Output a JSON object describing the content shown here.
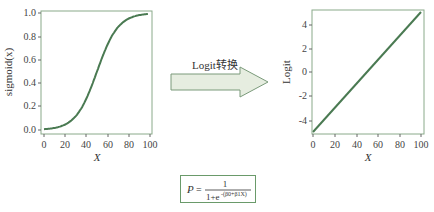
{
  "chart_data": [
    {
      "type": "line",
      "title": "",
      "xlabel": "X",
      "ylabel": "sigmoid(x)",
      "xlim": [
        0,
        100
      ],
      "ylim": [
        0.0,
        1.0
      ],
      "x_ticks": [
        "0",
        "20",
        "40",
        "60",
        "80",
        "100"
      ],
      "y_ticks": [
        "0.0",
        "0.2",
        "0.4",
        "0.6",
        "0.8",
        "1.0"
      ],
      "grid": false,
      "series": [
        {
          "name": "sigmoid",
          "x": [
            0,
            10,
            20,
            30,
            40,
            50,
            60,
            70,
            80,
            90,
            100
          ],
          "values": [
            0.007,
            0.018,
            0.047,
            0.119,
            0.269,
            0.5,
            0.731,
            0.881,
            0.953,
            0.982,
            0.993
          ]
        }
      ]
    },
    {
      "type": "line",
      "title": "",
      "xlabel": "X",
      "ylabel": "Logit",
      "xlim": [
        0,
        100
      ],
      "ylim": [
        -5,
        5
      ],
      "x_ticks": [
        "0",
        "20",
        "40",
        "60",
        "80",
        "100"
      ],
      "y_ticks": [
        "-4",
        "-2",
        "0",
        "2",
        "4"
      ],
      "grid": false,
      "series": [
        {
          "name": "logit",
          "x": [
            0,
            100
          ],
          "values": [
            -5,
            5
          ]
        }
      ]
    }
  ],
  "arrow": {
    "label": "Logit转换"
  },
  "formula": {
    "lhs": "P",
    "numerator": "1",
    "denominator_base": "1+e",
    "exponent": "-(β0+β1X)"
  },
  "colors": {
    "curve": "#4a7a52",
    "frame": "#8aaa8a",
    "arrow_fill": "#e6ede0",
    "arrow_stroke": "#7a9a7a"
  }
}
